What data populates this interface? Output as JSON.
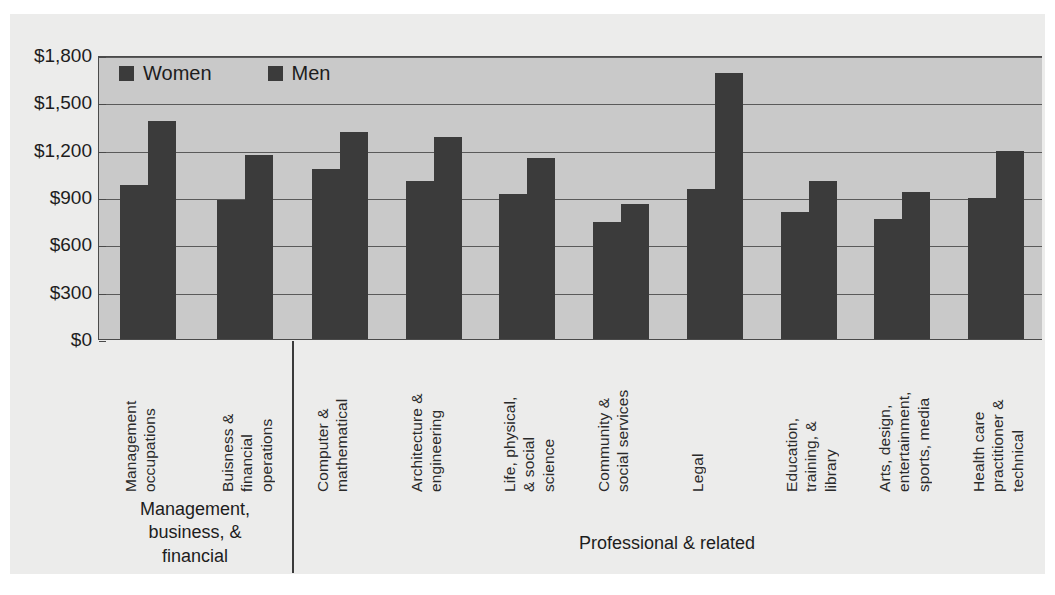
{
  "chart_data": {
    "type": "bar",
    "title": "",
    "xlabel": "",
    "ylabel": "",
    "ylim": [
      0,
      1800
    ],
    "ytick_values": [
      1800,
      1500,
      1200,
      900,
      600,
      300,
      0
    ],
    "ytick_labels": [
      "$1,800",
      "$1,500",
      "$1,200",
      "$900",
      "$600",
      "$300",
      "$0"
    ],
    "grid": true,
    "legend_position": "top-left",
    "categories": [
      "Management occupations",
      "Buisness & financial operations",
      "Computer & mathematical",
      "Architecture & engineering",
      "Life, physical, & social science",
      "Community & social services",
      "Legal",
      "Education, training, & library",
      "Arts, design, entertainment, sports, media",
      "Health care practitioner & technical"
    ],
    "category_lines": [
      "Management\noccupations",
      "Buisness &\nfinancial\noperations",
      "Computer &\nmathematical",
      "Architecture &\nengineering",
      "Life, physical,\n& social\nscience",
      "Community &\nsocial services",
      "Legal",
      "Education,\ntraining, &\nlibrary",
      "Arts, design,\nentertainment,\nsports, media",
      "Health care\npractitioner &\ntechnical"
    ],
    "series": [
      {
        "name": "Women",
        "color": "#3b3b3b",
        "values": [
          980,
          890,
          1085,
          1005,
          925,
          745,
          960,
          810,
          765,
          900
        ]
      },
      {
        "name": "Men",
        "color": "#3b3b3b",
        "values": [
          1390,
          1170,
          1320,
          1285,
          1155,
          860,
          1690,
          1010,
          940,
          1200
        ]
      }
    ],
    "groups": [
      {
        "label": "Management,\nbusiness, &\nfinancial",
        "categories": [
          0,
          1
        ]
      },
      {
        "label": "Professional & related",
        "categories": [
          2,
          3,
          4,
          5,
          6,
          7,
          8,
          9
        ]
      }
    ]
  },
  "legend": {
    "items": [
      {
        "label": "Women",
        "swatch": "#3b3b3b"
      },
      {
        "label": "Men",
        "swatch": "#3b3b3b"
      }
    ]
  },
  "colors": {
    "bar": "#3b3b3b",
    "plot_background": "#c9c9c9",
    "page_background": "#ececeb",
    "axis": "#4a4a4a",
    "gridline": "#5a5a5a",
    "text": "#1d1d1d"
  }
}
